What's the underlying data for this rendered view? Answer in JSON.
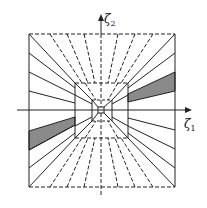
{
  "diagram": {
    "axes": {
      "x_label": "ζ",
      "x_sub": "1",
      "y_label": "ζ",
      "y_sub": "2"
    },
    "colors": {
      "stroke": "#222222",
      "fill_band": "#8a8a8a",
      "background": "#ffffff"
    },
    "regions": {
      "outer_square": [
        29,
        34,
        175,
        187
      ],
      "middle_rect": [
        75,
        83,
        128,
        138
      ],
      "inner_rect": [
        92,
        100,
        112,
        121
      ],
      "core_square": [
        98,
        107,
        104,
        113
      ]
    },
    "shaded_bands": [
      {
        "side": "right",
        "outer_y": [
          72,
          91
        ],
        "mid_y": [
          94,
          102
        ]
      },
      {
        "side": "left",
        "outer_y": [
          131,
          150
        ],
        "mid_y": [
          117,
          125
        ]
      }
    ]
  }
}
